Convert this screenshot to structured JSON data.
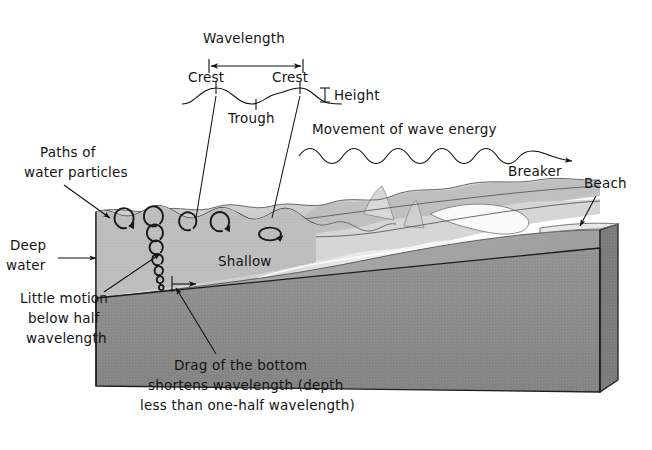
{
  "figure": {
    "title_visible": false,
    "background_color": "#ffffff",
    "ink_color": "#141414"
  },
  "labels": {
    "wavelength": "Wavelength",
    "crest_left": "Crest",
    "crest_right": "Crest",
    "trough": "Trough",
    "height": "Height",
    "movement": "Movement of wave energy",
    "breaker": "Breaker",
    "beach": "Beach",
    "paths_line1": "Paths of",
    "paths_line2": "water particles",
    "deep_line1": "Deep",
    "deep_line2": "water",
    "shallow": "Shallow",
    "little_line1": "Little motion",
    "little_line2": "below half",
    "little_line3": "wavelength",
    "drag_line1": "Drag of the bottom",
    "drag_line2": "shortens wavelength (depth",
    "drag_line3": "less than one-half wavelength)"
  },
  "colors": {
    "water_top_light": "#d8d8d8",
    "water_top_mid": "#c4c4c4",
    "water_left_face": "#b3b3b3",
    "water_left_face_dark": "#a3a3a3",
    "seafloor_front": "#8f8f8f",
    "seafloor_front_dark": "#868686",
    "foam_white": "#f2f2f2",
    "shadow_gray": "#9a9a9a",
    "outline": "#1c1c1c"
  },
  "diagram_data": {
    "type": "diagram",
    "subject": "Ocean wave anatomy and wave motion in deep vs shallow water",
    "annotations": [
      {
        "name": "wavelength",
        "role": "measurement",
        "points_to": "distance between two successive crests"
      },
      {
        "name": "crest",
        "role": "feature",
        "count": 2
      },
      {
        "name": "trough",
        "role": "feature",
        "count": 1
      },
      {
        "name": "height",
        "role": "measurement",
        "points_to": "vertical distance crest to trough"
      },
      {
        "name": "movement-of-wave-energy",
        "role": "direction",
        "direction": "left-to-right toward shore"
      },
      {
        "name": "breaker",
        "role": "feature",
        "points_to": "wave collapsing near shore"
      },
      {
        "name": "beach",
        "role": "feature",
        "points_to": "shoreline at right edge of block"
      },
      {
        "name": "paths-of-water-particles",
        "role": "callout",
        "points_to": "circular orbits near surface"
      },
      {
        "name": "deep-water",
        "role": "callout",
        "points_to": "left side of block"
      },
      {
        "name": "shallow",
        "role": "callout",
        "points_to": "right side over sloping bottom"
      },
      {
        "name": "little-motion-below-half-wavelength",
        "role": "callout",
        "points_to": "shrinking orbits with depth"
      },
      {
        "name": "drag-of-the-bottom",
        "role": "callout",
        "points_to": "seafloor slope shortening the wavelength"
      }
    ],
    "orbit_columns": [
      {
        "x_rel": 0.12,
        "circles": 1,
        "note": "single large orbit at surface"
      },
      {
        "x_rel": 0.26,
        "circles": 6,
        "note": "vertical column of shrinking orbits with depth"
      },
      {
        "x_rel": 0.46,
        "circles": 1,
        "note": "orbit at surface"
      },
      {
        "x_rel": 0.6,
        "circles": 1,
        "note": "flattened elliptical orbit"
      }
    ]
  }
}
